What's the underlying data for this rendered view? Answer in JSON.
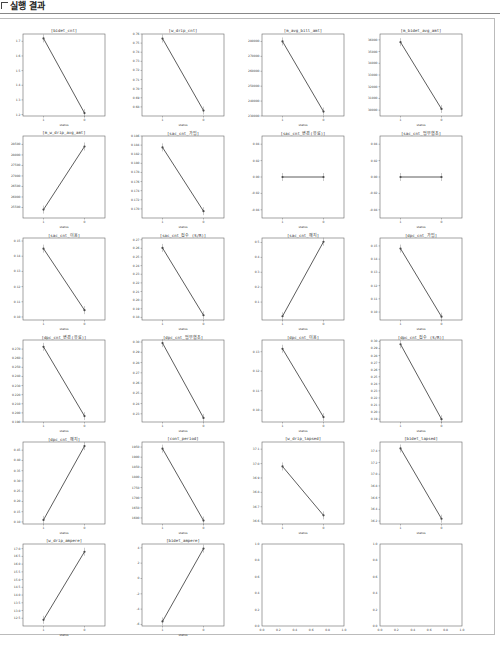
{
  "header": {
    "title": "실행 결과"
  },
  "colors": {
    "line": "#4a4a4a",
    "frame": "#666666",
    "panel_border": "#bbbbbb"
  },
  "chart_data": [
    {
      "type": "line",
      "title": "[bidet_cnt]",
      "xlabel": "status",
      "x": [
        "1",
        "0"
      ],
      "values": [
        1.72,
        1.21
      ],
      "ylim": [
        1.19,
        1.75
      ],
      "yticks": [
        "1.2",
        "1.3",
        "1.4",
        "1.5",
        "1.6",
        "1.7"
      ]
    },
    {
      "type": "line",
      "title": "[w_drip_cnt]",
      "xlabel": "status",
      "x": [
        "1",
        "0"
      ],
      "values": [
        0.755,
        0.676
      ],
      "ylim": [
        0.67,
        0.76
      ],
      "yticks": [
        "0.68",
        "0.69",
        "0.70",
        "0.71",
        "0.72",
        "0.73",
        "0.74",
        "0.75",
        "0.76"
      ]
    },
    {
      "type": "line",
      "title": "[m_avg_bill_amt]",
      "xlabel": "status",
      "x": [
        "1",
        "0"
      ],
      "values": [
        280000,
        233000
      ],
      "ylim": [
        230000,
        285000
      ],
      "yticks": [
        "230000",
        "240000",
        "250000",
        "260000",
        "270000",
        "280000"
      ]
    },
    {
      "type": "line",
      "title": "[m_bidet_avg_amt]",
      "xlabel": "status",
      "x": [
        "1",
        "0"
      ],
      "values": [
        35800,
        30100
      ],
      "ylim": [
        29500,
        36500
      ],
      "yticks": [
        "30000",
        "31000",
        "32000",
        "33000",
        "34000",
        "35000",
        "36000"
      ]
    },
    {
      "type": "line",
      "title": "[m_w_drip_avg_amt]",
      "xlabel": "status",
      "x": [
        "1",
        "0"
      ],
      "values": [
        25400,
        28400
      ],
      "ylim": [
        25000,
        28900
      ],
      "yticks": [
        "25500",
        "26000",
        "26500",
        "27000",
        "27500",
        "28000",
        "28500"
      ]
    },
    {
      "type": "line",
      "title": "[sac_cnt_가입]",
      "xlabel": "status",
      "x": [
        "1",
        "0"
      ],
      "values": [
        0.1835,
        0.1695
      ],
      "ylim": [
        0.168,
        0.186
      ],
      "yticks": [
        "0.170",
        "0.172",
        "0.174",
        "0.176",
        "0.178",
        "0.180",
        "0.182",
        "0.184",
        "0.186"
      ]
    },
    {
      "type": "line",
      "title": "[sac_cnt_변경(유료)]",
      "xlabel": "status",
      "x": [
        "1",
        "0"
      ],
      "values": [
        0.0,
        0.0
      ],
      "ylim": [
        -0.05,
        0.05
      ],
      "yticks": [
        "-0.04",
        "-0.02",
        "0.00",
        "0.02",
        "0.04"
      ]
    },
    {
      "type": "line",
      "title": "[sac_cnt_업무협조]",
      "xlabel": "status",
      "x": [
        "1",
        "0"
      ],
      "values": [
        0.0,
        0.0
      ],
      "ylim": [
        -0.05,
        0.05
      ],
      "yticks": [
        "-0.04",
        "-0.02",
        "0.00",
        "0.02",
        "0.04"
      ]
    },
    {
      "type": "line",
      "title": "[sac_cnt_이용]",
      "xlabel": "status",
      "x": [
        "1",
        "0"
      ],
      "values": [
        0.145,
        0.1045
      ],
      "ylim": [
        0.098,
        0.152
      ],
      "yticks": [
        "0.10",
        "0.11",
        "0.12",
        "0.13",
        "0.14",
        "0.15"
      ]
    },
    {
      "type": "line",
      "title": "[sac_cnt_접수 (S/R)]",
      "xlabel": "status",
      "x": [
        "1",
        "0"
      ],
      "values": [
        0.2605,
        0.1825
      ],
      "ylim": [
        0.177,
        0.272
      ],
      "yticks": [
        "0.18",
        "0.19",
        "0.20",
        "0.21",
        "0.22",
        "0.23",
        "0.24",
        "0.25",
        "0.26",
        "0.27"
      ]
    },
    {
      "type": "line",
      "title": "[sac_cnt_해지]",
      "xlabel": "status",
      "x": [
        "1",
        "0"
      ],
      "values": [
        0.005,
        0.505
      ],
      "ylim": [
        -0.02,
        0.53
      ],
      "yticks": [
        "0.1",
        "0.2",
        "0.3",
        "0.4",
        "0.5"
      ]
    },
    {
      "type": "line",
      "title": "[dpc_cnt_가입]",
      "xlabel": "status",
      "x": [
        "1",
        "0"
      ],
      "values": [
        0.148,
        0.0965
      ],
      "ylim": [
        0.094,
        0.156
      ],
      "yticks": [
        "0.10",
        "0.11",
        "0.12",
        "0.13",
        "0.14",
        "0.15"
      ]
    },
    {
      "type": "line",
      "title": "[dpc_cnt_변경(유료)]",
      "xlabel": "status",
      "x": [
        "1",
        "0"
      ],
      "values": [
        0.2725,
        0.1965
      ],
      "ylim": [
        0.19,
        0.28
      ],
      "yticks": [
        "0.190",
        "0.200",
        "0.210",
        "0.220",
        "0.230",
        "0.240",
        "0.250",
        "0.260",
        "0.270"
      ]
    },
    {
      "type": "line",
      "title": "[dpc_cnt_업무협조]",
      "xlabel": "status",
      "x": [
        "1",
        "0"
      ],
      "values": [
        0.299,
        0.226
      ],
      "ylim": [
        0.222,
        0.302
      ],
      "yticks": [
        "0.23",
        "0.24",
        "0.25",
        "0.26",
        "0.27",
        "0.28",
        "0.29",
        "0.30"
      ]
    },
    {
      "type": "line",
      "title": "[dpc_cnt_이용]",
      "xlabel": "status",
      "x": [
        "1",
        "0"
      ],
      "values": [
        0.1315,
        0.0965
      ],
      "ylim": [
        0.094,
        0.136
      ],
      "yticks": [
        "0.10",
        "0.11",
        "0.12",
        "0.13"
      ]
    },
    {
      "type": "line",
      "title": "[dpc_cnt_접수 (S/R)]",
      "xlabel": "status",
      "x": [
        "1",
        "0"
      ],
      "values": [
        0.296,
        0.19
      ],
      "ylim": [
        0.186,
        0.302
      ],
      "yticks": [
        "0.19",
        "0.20",
        "0.21",
        "0.22",
        "0.23",
        "0.24",
        "0.25",
        "0.26",
        "0.27",
        "0.28",
        "0.29",
        "0.30"
      ]
    },
    {
      "type": "line",
      "title": "[dpc_cnt_해지]",
      "xlabel": "status",
      "x": [
        "1",
        "0"
      ],
      "values": [
        0.11,
        0.47
      ],
      "ylim": [
        0.09,
        0.49
      ],
      "yticks": [
        "0.10",
        "0.15",
        "0.20",
        "0.25",
        "0.30",
        "0.35",
        "0.40",
        "0.45"
      ]
    },
    {
      "type": "line",
      "title": "[cont_period]",
      "xlabel": "status",
      "x": [
        "1",
        "0"
      ],
      "values": [
        1942,
        1587
      ],
      "ylim": [
        1570,
        1975
      ],
      "yticks": [
        "1600",
        "1650",
        "1700",
        "1750",
        "1800",
        "1850",
        "1900",
        "1950"
      ]
    },
    {
      "type": "line",
      "title": "[w_drip_lapsed]",
      "xlabel": "status",
      "x": [
        "1",
        "0"
      ],
      "values": [
        36.98,
        36.64
      ],
      "ylim": [
        36.58,
        37.15
      ],
      "yticks": [
        "36.6",
        "36.7",
        "36.8",
        "36.9",
        "37.0",
        "37.1"
      ]
    },
    {
      "type": "line",
      "title": "[bidet_lapsed]",
      "xlabel": "status",
      "x": [
        "1",
        "0"
      ],
      "values": [
        37.44,
        36.24
      ],
      "ylim": [
        36.15,
        37.55
      ],
      "yticks": [
        "36.2",
        "36.4",
        "36.6",
        "36.8",
        "37.0",
        "37.2",
        "37.4"
      ]
    },
    {
      "type": "line",
      "title": "[w_drip_ampere]",
      "xlabel": "status",
      "x": [
        "1",
        "0"
      ],
      "values": [
        12.4,
        16.8
      ],
      "ylim": [
        12.0,
        17.3
      ],
      "yticks": [
        "12.5",
        "13.0",
        "13.5",
        "14.0",
        "14.5",
        "15.0",
        "15.5",
        "16.0",
        "16.5",
        "17.0"
      ]
    },
    {
      "type": "line",
      "title": "[bidet_ampere]",
      "xlabel": "status",
      "x": [
        "1",
        "0"
      ],
      "values": [
        -5.6,
        3.9
      ],
      "ylim": [
        -6.2,
        4.5
      ],
      "yticks": [
        "-6",
        "-4",
        "-2",
        "0",
        "2",
        "4"
      ]
    },
    {
      "type": "empty",
      "title": "",
      "xlabel": "",
      "xticks": [
        "0.0",
        "0.2",
        "0.4",
        "0.6",
        "0.8",
        "1.0"
      ],
      "yticks": [
        "0.0",
        "0.2",
        "0.4",
        "0.6",
        "0.8",
        "1.0"
      ]
    },
    {
      "type": "empty",
      "title": "",
      "xlabel": "",
      "xticks": [
        "0.0",
        "0.2",
        "0.4",
        "0.6",
        "0.8",
        "1.0"
      ],
      "yticks": [
        "0.0",
        "0.2",
        "0.4",
        "0.6",
        "0.8",
        "1.0"
      ]
    }
  ]
}
